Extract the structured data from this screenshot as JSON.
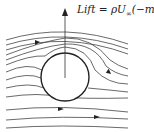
{
  "diagram": {
    "label": {
      "lift_prefix": "Lift = ρU",
      "subscript": "∞",
      "suffix": "(−m)"
    },
    "elements": [
      "cylinder",
      "lift-arrow",
      "streamlines",
      "flow-direction-arrows"
    ],
    "colors": {
      "stroke": "#333333",
      "background": "#ffffff"
    }
  }
}
